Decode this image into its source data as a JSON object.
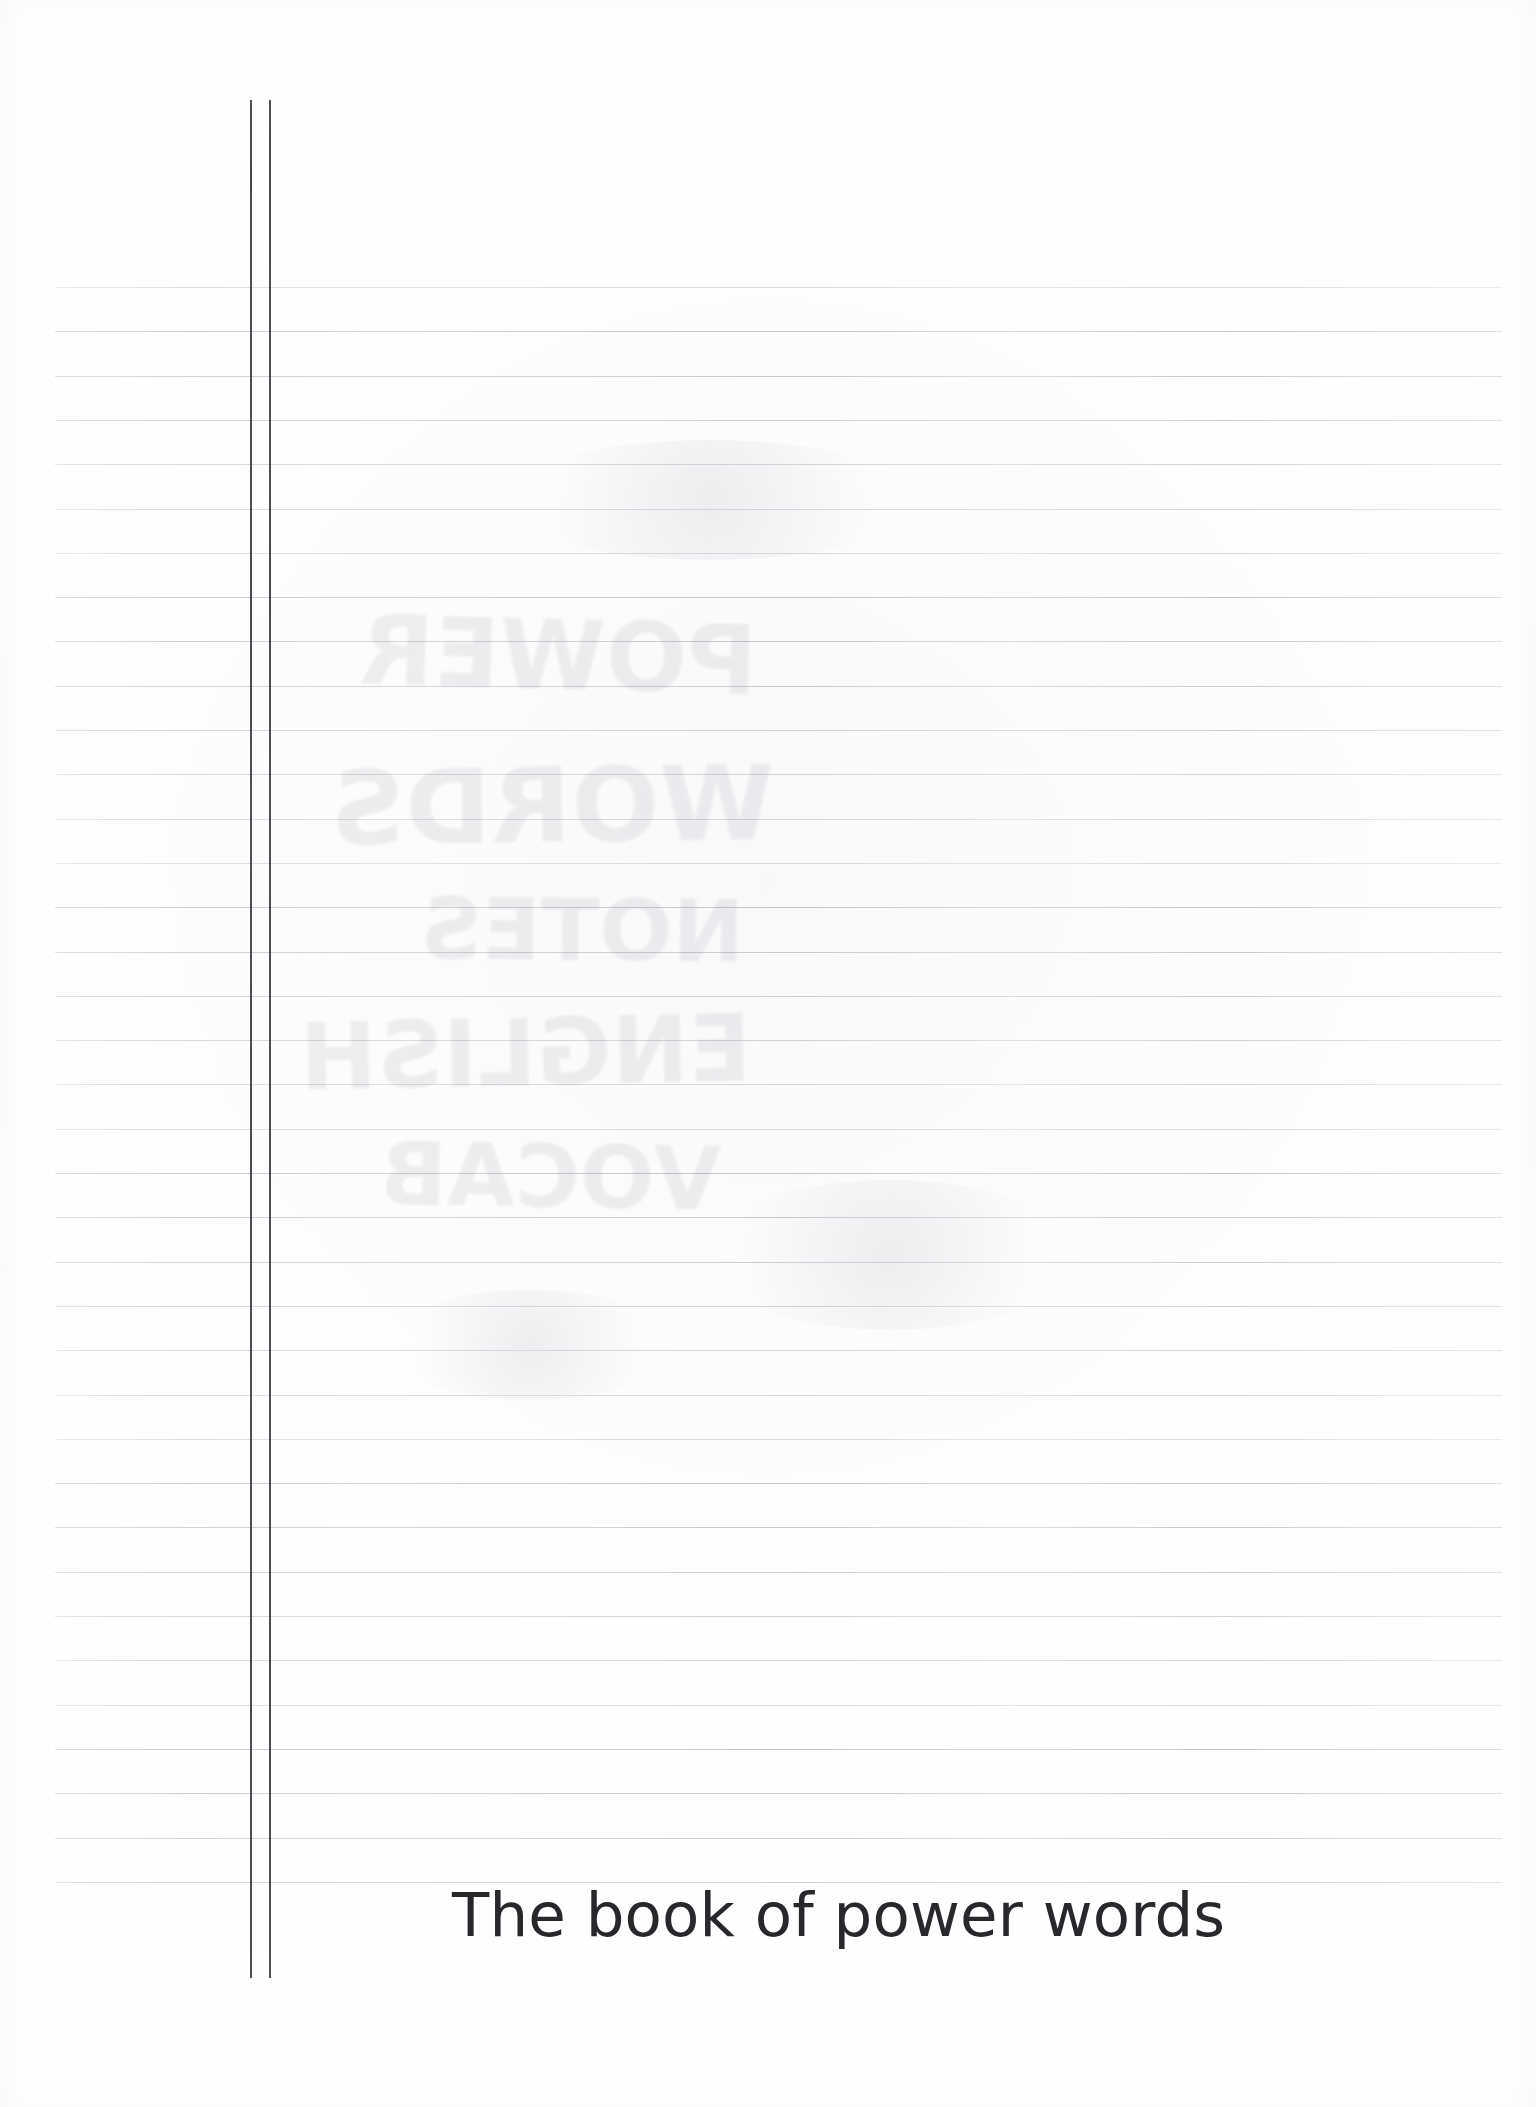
{
  "document": {
    "kind": "scanned-lined-notebook-page",
    "page_width": 1536,
    "page_height": 2107,
    "background_color": "#ffffff"
  },
  "title": {
    "text": "The book of power words",
    "color": "#26282c",
    "left": 452,
    "baseline_top": 1884,
    "font_size": 61
  },
  "ruling": {
    "line_color": "#d3d5da",
    "first_line_y": 287,
    "line_spacing": 44.3,
    "line_count": 37,
    "line_left": 55,
    "line_right": 1502
  },
  "margin_rules": {
    "line_color": "#3f4248",
    "top": 100,
    "bottom": 1978,
    "x_positions": [
      250,
      269
    ],
    "width": 2
  },
  "show_through": {
    "note": "faint mirrored pencil writing bleeding through from the reverse side of the sheet",
    "color": "#5d5a6b",
    "opacity": 0.085,
    "lines": [
      {
        "text": "POWER",
        "left": 360,
        "top": 600,
        "size": 96,
        "rotate": -1.5
      },
      {
        "text": "WORDS",
        "left": 330,
        "top": 745,
        "size": 104,
        "rotate": 0.8
      },
      {
        "text": "NOTES",
        "left": 420,
        "top": 880,
        "size": 86,
        "rotate": -0.6
      },
      {
        "text": "ENGLISH",
        "left": 300,
        "top": 1000,
        "size": 92,
        "rotate": 1.2
      },
      {
        "text": "VOCAB",
        "left": 380,
        "top": 1125,
        "size": 88,
        "rotate": -0.9
      }
    ]
  },
  "smudges": [
    {
      "left": 500,
      "top": 440,
      "w": 420,
      "h": 120
    },
    {
      "left": 700,
      "top": 1180,
      "w": 380,
      "h": 150
    },
    {
      "left": 380,
      "top": 1290,
      "w": 300,
      "h": 110
    }
  ]
}
